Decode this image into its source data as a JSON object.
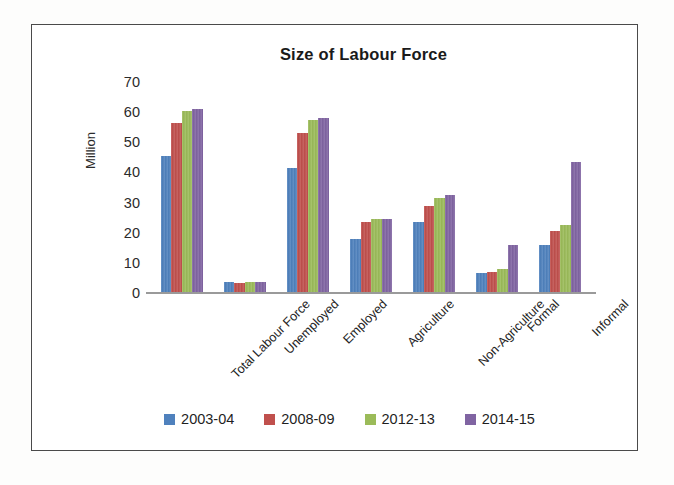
{
  "chart_data": {
    "type": "bar",
    "title": "Size of Labour Force",
    "xlabel": "",
    "ylabel": "Million",
    "ylim": [
      0,
      70
    ],
    "yticks": [
      70,
      60,
      50,
      40,
      30,
      20,
      10,
      0
    ],
    "grid": false,
    "legend_position": "bottom",
    "categories": [
      "Total Labour Force",
      "Unemployed",
      "Employed",
      "Agriculture",
      "Non-Agriculture",
      "Formal",
      "Informal"
    ],
    "series": [
      {
        "name": "2003-04",
        "color": "#4f81bd",
        "values": [
          45.5,
          3.5,
          41.5,
          18.0,
          23.5,
          6.5,
          16.0
        ]
      },
      {
        "name": "2008-09",
        "color": "#c0504d",
        "values": [
          56.5,
          3.3,
          53.0,
          23.5,
          29.0,
          7.0,
          20.5
        ]
      },
      {
        "name": "2012-13",
        "color": "#9bbb59",
        "values": [
          60.5,
          3.7,
          57.5,
          24.5,
          31.5,
          8.0,
          22.5
        ]
      },
      {
        "name": "2014-15",
        "color": "#8064a2",
        "values": [
          61.0,
          3.6,
          58.0,
          24.5,
          32.5,
          16.0,
          43.5
        ]
      }
    ]
  },
  "frame": {
    "border_color": "#4a4a4a",
    "background": "#ffffff"
  }
}
